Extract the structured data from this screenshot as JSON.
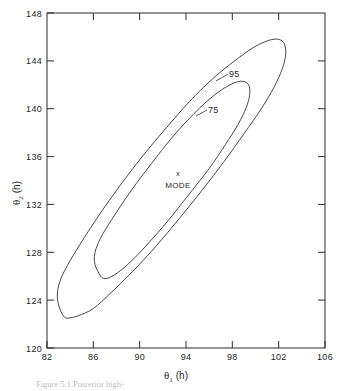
{
  "chart_data": {
    "type": "line",
    "title": "",
    "subtitle": "",
    "xlabel": "θ₁ (h)",
    "ylabel": "θ₂ (h)",
    "xlabel_symbol": "θ",
    "xlabel_subscript": "1",
    "xlabel_unit": "(h)",
    "ylabel_symbol": "θ",
    "ylabel_subscript": "2",
    "ylabel_unit": "(h)",
    "xlim": [
      82,
      106
    ],
    "ylim": [
      120,
      148
    ],
    "xticks": [
      82,
      86,
      90,
      94,
      98,
      102,
      106
    ],
    "yticks": [
      120,
      124,
      128,
      132,
      136,
      140,
      144,
      148
    ],
    "xtick_labels": [
      "82",
      "86",
      "90",
      "94",
      "98",
      "102",
      "106"
    ],
    "ytick_labels": [
      "120",
      "124",
      "128",
      "132",
      "136",
      "140",
      "144",
      "148"
    ],
    "grid": false,
    "legend_position": "none",
    "tick_direction": "in",
    "frame": "full-box",
    "contours": [
      {
        "name": "outer-contour",
        "label": ".95",
        "label_text": "95",
        "level": 0.95,
        "label_x": 97.3,
        "label_y": 143.2,
        "description": "95% highest posterior density region, elongated diagonal ellipse",
        "points": [
          [
            83.4,
            122.7
          ],
          [
            83.0,
            123.6
          ],
          [
            82.9,
            124.6
          ],
          [
            83.2,
            125.8
          ],
          [
            84.0,
            127.3
          ],
          [
            85.2,
            129.2
          ],
          [
            86.7,
            131.4
          ],
          [
            88.4,
            133.7
          ],
          [
            90.3,
            136.1
          ],
          [
            92.3,
            138.4
          ],
          [
            94.3,
            140.6
          ],
          [
            96.3,
            142.5
          ],
          [
            98.2,
            144.0
          ],
          [
            99.8,
            145.1
          ],
          [
            101.1,
            145.7
          ],
          [
            102.0,
            145.8
          ],
          [
            102.5,
            145.4
          ],
          [
            102.6,
            144.5
          ],
          [
            102.3,
            143.3
          ],
          [
            101.6,
            141.8
          ],
          [
            100.5,
            140.0
          ],
          [
            99.0,
            137.9
          ],
          [
            97.3,
            135.6
          ],
          [
            95.4,
            133.2
          ],
          [
            93.4,
            130.8
          ],
          [
            91.4,
            128.5
          ],
          [
            89.4,
            126.4
          ],
          [
            87.5,
            124.6
          ],
          [
            86.0,
            123.3
          ],
          [
            84.7,
            122.7
          ],
          [
            83.8,
            122.5
          ],
          [
            83.4,
            122.7
          ]
        ]
      },
      {
        "name": "inner-contour",
        "label": ".75",
        "label_text": "75",
        "level": 0.75,
        "label_x": 92.3,
        "label_y": 139.5,
        "description": "75% highest posterior density region, narrower diagonal ellipse",
        "points": [
          [
            86.4,
            126.4
          ],
          [
            86.1,
            127.2
          ],
          [
            86.2,
            128.2
          ],
          [
            86.8,
            129.5
          ],
          [
            87.9,
            131.2
          ],
          [
            89.3,
            133.2
          ],
          [
            91.0,
            135.4
          ],
          [
            92.8,
            137.6
          ],
          [
            94.7,
            139.6
          ],
          [
            96.4,
            141.1
          ],
          [
            97.8,
            142.0
          ],
          [
            98.8,
            142.3
          ],
          [
            99.4,
            142.0
          ],
          [
            99.5,
            141.2
          ],
          [
            99.2,
            140.1
          ],
          [
            98.5,
            138.7
          ],
          [
            97.4,
            137.0
          ],
          [
            96.0,
            135.0
          ],
          [
            94.3,
            132.9
          ],
          [
            92.5,
            130.7
          ],
          [
            90.7,
            128.7
          ],
          [
            89.1,
            127.1
          ],
          [
            87.8,
            126.1
          ],
          [
            86.9,
            125.8
          ],
          [
            86.4,
            126.4
          ]
        ]
      }
    ],
    "annotations": [
      {
        "name": "mode-point",
        "label": "MODE",
        "marker": "x",
        "x": 92.7,
        "y": 133.6,
        "marker_x": 92.75,
        "marker_y": 134.5
      }
    ]
  },
  "caption": {
    "text": "Figure 5.1  Posterior high-",
    "visible": "partially-cropped"
  }
}
